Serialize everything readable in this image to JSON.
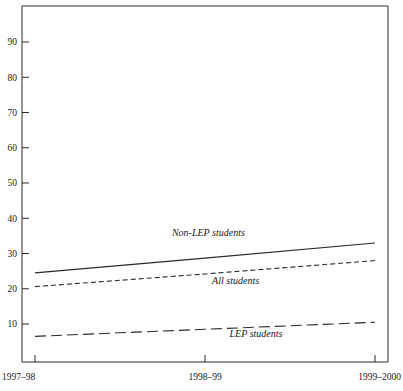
{
  "chart_data": {
    "type": "line",
    "title": "",
    "subtitle": "",
    "xlabel": "",
    "ylabel": "",
    "x": [
      "1997–98",
      "1998–99",
      "1999–2000"
    ],
    "categories": [
      "1997–98",
      "1998–99",
      "1999–2000"
    ],
    "ylim": [
      0,
      100
    ],
    "y_ticks": [
      10,
      20,
      30,
      40,
      50,
      60,
      70,
      80,
      90
    ],
    "y_tick_labels": [
      "10",
      "20",
      "30",
      "40",
      "50",
      "60",
      "70",
      "80",
      "90"
    ],
    "grid": false,
    "legend_position": "inline-annotations",
    "series": [
      {
        "name": "Non-LEP students",
        "style": "solid",
        "values": [
          24.5,
          28.7,
          33.0
        ]
      },
      {
        "name": "All students",
        "style": "dashed",
        "values": [
          20.6,
          24.2,
          28.0
        ]
      },
      {
        "name": "LEP students",
        "style": "long-dashed",
        "values": [
          6.5,
          8.5,
          10.5
        ]
      }
    ],
    "annotations": [
      {
        "text": "Non-LEP students",
        "x": 1.02,
        "y": 35.0
      },
      {
        "text": "All students",
        "x": 1.18,
        "y": 21.3
      },
      {
        "text": "LEP students",
        "x": 1.3,
        "y": 6.3
      }
    ]
  },
  "colors": {
    "line": "#2b2b2b",
    "axis": "#2b2b2b",
    "text": "#1a1a1a",
    "background": "#ffffff"
  }
}
